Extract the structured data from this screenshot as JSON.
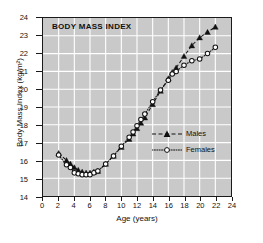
{
  "chart_data": {
    "type": "line",
    "title": "BODY MASS INDEX",
    "xlabel": "Age (years)",
    "ylabel": "Body Mass Index  (kg/m²)",
    "xlim": [
      0,
      24
    ],
    "ylim": [
      14,
      24
    ],
    "xticks": [
      0,
      2,
      4,
      6,
      8,
      10,
      12,
      14,
      16,
      18,
      20,
      22,
      24
    ],
    "yticks": [
      14,
      15,
      16,
      17,
      18,
      19,
      20,
      21,
      22,
      23,
      24
    ],
    "grid": true,
    "grid_color": "#ffffff",
    "plot_background": "#c9c9c9",
    "legend_position": "inside-right-middle",
    "series": [
      {
        "name": "Males",
        "marker": "filled-triangle",
        "linestyle": "dashed",
        "color": "#111111",
        "x": [
          2,
          3,
          3.5,
          4,
          4.5,
          5,
          5.5,
          6,
          6.5,
          7,
          8,
          9,
          10,
          11,
          11.5,
          12,
          12.5,
          13,
          14,
          15,
          16,
          16.5,
          17,
          18,
          19,
          20,
          21,
          22
        ],
        "y": [
          16.4,
          16.0,
          15.8,
          15.6,
          15.45,
          15.35,
          15.3,
          15.3,
          15.35,
          15.4,
          15.8,
          16.25,
          16.75,
          17.2,
          17.5,
          17.8,
          18.1,
          18.4,
          19.15,
          19.9,
          20.6,
          20.95,
          21.2,
          21.85,
          22.45,
          22.9,
          23.2,
          23.5
        ]
      },
      {
        "name": "Females",
        "marker": "open-circle",
        "linestyle": "dotted",
        "color": "#111111",
        "x": [
          2,
          3,
          3.5,
          4,
          4.5,
          5,
          5.5,
          6,
          6.5,
          7,
          8,
          9,
          10,
          11,
          11.5,
          12,
          12.5,
          13,
          14,
          15,
          16,
          16.5,
          17,
          18,
          19,
          20,
          21,
          22
        ],
        "y": [
          16.3,
          15.75,
          15.6,
          15.3,
          15.25,
          15.2,
          15.2,
          15.2,
          15.3,
          15.4,
          15.8,
          16.25,
          16.8,
          17.3,
          17.6,
          17.95,
          18.3,
          18.6,
          19.3,
          19.95,
          20.5,
          20.85,
          21.0,
          21.35,
          21.6,
          21.7,
          22.0,
          22.35
        ]
      }
    ]
  }
}
